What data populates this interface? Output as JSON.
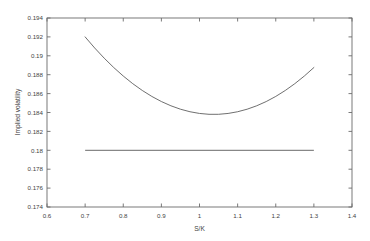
{
  "chart_data": {
    "type": "line",
    "title": "",
    "xlabel": "S/K",
    "ylabel": "Implied volatility",
    "xlim": [
      0.6,
      1.4
    ],
    "ylim": [
      0.174,
      0.194
    ],
    "grid": false,
    "legend": "none",
    "xticks": [
      0.6,
      0.7,
      0.8,
      0.9,
      1.0,
      1.1,
      1.2,
      1.3,
      1.4
    ],
    "xticklabels": [
      "0.6",
      "0.7",
      "0.8",
      "0.9",
      "1",
      "1.1",
      "1.2",
      "1.3",
      "1.4"
    ],
    "yticks": [
      0.174,
      0.176,
      0.178,
      0.18,
      0.182,
      0.184,
      0.186,
      0.188,
      0.19,
      0.192,
      0.194
    ],
    "yticklabels": [
      "0.174",
      "0.176",
      "0.178",
      "0.18",
      "0.182",
      "0.184",
      "0.186",
      "0.188",
      "0.19",
      "0.192",
      "0.194"
    ],
    "series": [
      {
        "name": "implied-volatility-smile",
        "type": "line",
        "color": "#555555",
        "x": [
          0.7,
          0.725,
          0.75,
          0.775,
          0.8,
          0.825,
          0.85,
          0.875,
          0.9,
          0.925,
          0.95,
          0.975,
          1.0,
          1.025,
          1.05,
          1.075,
          1.1,
          1.125,
          1.15,
          1.175,
          1.2,
          1.225,
          1.25,
          1.275,
          1.3
        ],
        "y": [
          0.192,
          0.19083,
          0.18975,
          0.18876,
          0.18786,
          0.18705,
          0.18633,
          0.1857,
          0.18516,
          0.18471,
          0.18435,
          0.18408,
          0.1839,
          0.18381,
          0.18381,
          0.1839,
          0.18408,
          0.18435,
          0.18471,
          0.18516,
          0.1857,
          0.18633,
          0.18705,
          0.18786,
          0.18876
        ]
      },
      {
        "name": "flat-implied-volatility",
        "type": "line",
        "color": "#6a6a6a",
        "x": [
          0.7,
          1.3
        ],
        "y": [
          0.18,
          0.18
        ]
      }
    ],
    "annotations": {
      "smile_minimum_x": 1.0,
      "smile_minimum_y": 0.1749,
      "smile_endpoint_y": 0.192,
      "flat_level": 0.18,
      "crossing_left_x": 0.845,
      "crossing_right_x": 1.157
    }
  }
}
